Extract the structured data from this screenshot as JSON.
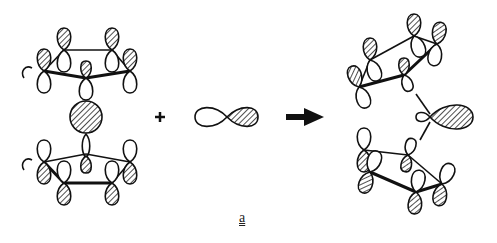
{
  "figure": {
    "type": "molecular orbital interaction diagram",
    "reactants": {
      "left": "metallocene-like sandwich with two cyclopentadienyl rings, p orbitals and central metal orbital",
      "middle": "p orbital (one lobe shaded)"
    },
    "operator_plus": "+",
    "arrow": "reaction-arrow",
    "product": "bent sandwich with shaded hybrid orbital",
    "label": "a",
    "colors": {
      "ink": "#111111",
      "background": "#ffffff"
    }
  }
}
